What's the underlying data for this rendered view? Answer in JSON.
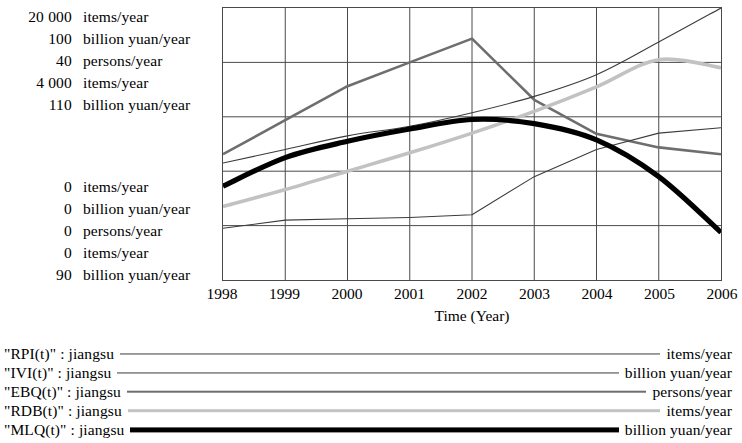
{
  "axis_scales_top": [
    {
      "value": "20 000",
      "unit": "items/year"
    },
    {
      "value": "100",
      "unit": "billion yuan/year"
    },
    {
      "value": "40",
      "unit": "persons/year"
    },
    {
      "value": "4 000",
      "unit": "items/year"
    },
    {
      "value": "110",
      "unit": "billion yuan/year"
    }
  ],
  "axis_scales_bottom": [
    {
      "value": "0",
      "unit": "items/year"
    },
    {
      "value": "0",
      "unit": "billion yuan/year"
    },
    {
      "value": "0",
      "unit": "persons/year"
    },
    {
      "value": "0",
      "unit": "items/year"
    },
    {
      "value": "90",
      "unit": "billion yuan/year"
    }
  ],
  "x_axis": {
    "title": "Time (Year)",
    "ticks": [
      "1998",
      "1999",
      "2000",
      "2001",
      "2002",
      "2003",
      "2004",
      "2005",
      "2006"
    ]
  },
  "legend": [
    {
      "name": "\"RPI(t)\" : jiangsu",
      "unit": "items/year",
      "color": "#3c3c3c",
      "width": 1.1
    },
    {
      "name": "\"IVI(t)\" : jiangsu",
      "unit": "billion yuan/year",
      "color": "#3c3c3c",
      "width": 1.1
    },
    {
      "name": "\"EBQ(t)\" : jiangsu",
      "unit": "persons/year",
      "color": "#6e6e6e",
      "width": 2.6
    },
    {
      "name": "\"RDB(t)\" : jiangsu",
      "unit": "items/year",
      "color": "#c2c2c2",
      "width": 3.6
    },
    {
      "name": "\"MLQ(t)\" : jiangsu",
      "unit": "billion yuan/year",
      "color": "#000000",
      "width": 5.2
    }
  ],
  "chart_data": {
    "type": "line",
    "title": "",
    "subtitle": "",
    "xlabel": "Time (Year)",
    "ylabel": "",
    "x": [
      1998,
      1999,
      2000,
      2001,
      2002,
      2003,
      2004,
      2005,
      2006
    ],
    "xlim": [
      1998,
      2006
    ],
    "grid": true,
    "gridlines_x": [
      1998,
      1999,
      2000,
      2001,
      2002,
      2003,
      2004,
      2005,
      2006
    ],
    "gridlines_y_count": 5,
    "legend_position": "below",
    "note": "Vensim-style multi-scale plot: each series is drawn against its own y-axis range, listed top-to-bottom in the left scale column.",
    "series": [
      {
        "name": "\"RPI(t)\" : jiangsu",
        "key": "RPI",
        "unit": "items/year",
        "ylim": [
          0,
          20000
        ],
        "color": "#3c3c3c",
        "width": 1.1,
        "values": [
          8600,
          9600,
          10600,
          11300,
          12300,
          13500,
          15100,
          17500,
          20000
        ]
      },
      {
        "name": "\"IVI(t)\" : jiangsu",
        "key": "IVI",
        "unit": "billion yuan/year",
        "ylim": [
          0,
          100
        ],
        "color": "#3c3c3c",
        "width": 1.1,
        "values": [
          19,
          22,
          22.5,
          23,
          24,
          38,
          48,
          54,
          56
        ]
      },
      {
        "name": "\"EBQ(t)\" : jiangsu",
        "key": "EBQ",
        "unit": "persons/year",
        "ylim": [
          0,
          40
        ],
        "color": "#6e6e6e",
        "width": 2.6,
        "values": [
          18.5,
          23.5,
          28.5,
          32,
          35.5,
          26.5,
          21.5,
          19.5,
          18.5
        ]
      },
      {
        "name": "\"RDB(t)\" : jiangsu",
        "key": "RDB",
        "unit": "items/year",
        "ylim": [
          0,
          4000
        ],
        "color": "#c2c2c2",
        "width": 3.6,
        "values": [
          1080,
          1330,
          1600,
          1870,
          2160,
          2480,
          2840,
          3240,
          3120
        ]
      },
      {
        "name": "\"MLQ(t)\" : jiangsu",
        "key": "MLQ",
        "unit": "billion yuan/year",
        "ylim": [
          90,
          110
        ],
        "color": "#000000",
        "width": 5.2,
        "values": [
          96.9,
          99.0,
          100.2,
          101.1,
          101.8,
          101.5,
          100.3,
          97.6,
          93.5
        ]
      }
    ]
  }
}
